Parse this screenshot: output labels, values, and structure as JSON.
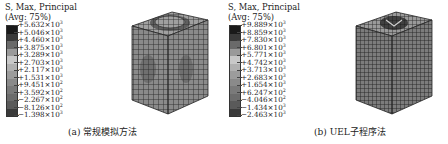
{
  "figure": {
    "panels": [
      {
        "id": "a",
        "legend": {
          "title_line1": "S, Max, Principal",
          "title_line2": "(Avg: 75%)",
          "swatch_colors": [
            "#1a1a1a",
            "#3a3a3a",
            "#6a6a6a",
            "#9a9a9a",
            "#c8c8c8",
            "#b0b0b0",
            "#9c9c9c",
            "#8a8a8a",
            "#7a7a7a",
            "#6c6c6c",
            "#5a5a5a",
            "#3a3a3a",
            "#222222"
          ],
          "labels": [
            {
              "mantissa": "+5.632",
              "exp": "3"
            },
            {
              "mantissa": "+5.046",
              "exp": "3"
            },
            {
              "mantissa": "+4.460",
              "exp": "3"
            },
            {
              "mantissa": "+3.875",
              "exp": "3"
            },
            {
              "mantissa": "+3.289",
              "exp": "3"
            },
            {
              "mantissa": "+2.703",
              "exp": "3"
            },
            {
              "mantissa": "+2.117",
              "exp": "3"
            },
            {
              "mantissa": "+1.531",
              "exp": "3"
            },
            {
              "mantissa": "+9.451",
              "exp": "2"
            },
            {
              "mantissa": "+3.592",
              "exp": "2"
            },
            {
              "mantissa": "−2.267",
              "exp": "2"
            },
            {
              "mantissa": "−8.126",
              "exp": "2"
            },
            {
              "mantissa": "−1.398",
              "exp": "3"
            }
          ]
        },
        "model_feature": "circular-indent-top",
        "caption": "(a) 常规模拟方法"
      },
      {
        "id": "b",
        "legend": {
          "title_line1": "S, Max, Principal",
          "title_line2": "(Avg: 75%)",
          "swatch_colors": [
            "#1a1a1a",
            "#3a3a3a",
            "#6a6a6a",
            "#9a9a9a",
            "#c8c8c8",
            "#b0b0b0",
            "#9c9c9c",
            "#8a8a8a",
            "#7a7a7a",
            "#6c6c6c",
            "#5a5a5a",
            "#3a3a3a",
            "#222222"
          ],
          "labels": [
            {
              "mantissa": "+9.889",
              "exp": "3"
            },
            {
              "mantissa": "+8.859",
              "exp": "3"
            },
            {
              "mantissa": "+7.830",
              "exp": "3"
            },
            {
              "mantissa": "+6.801",
              "exp": "3"
            },
            {
              "mantissa": "+5.771",
              "exp": "3"
            },
            {
              "mantissa": "+4.742",
              "exp": "3"
            },
            {
              "mantissa": "+3.713",
              "exp": "3"
            },
            {
              "mantissa": "+2.683",
              "exp": "3"
            },
            {
              "mantissa": "+1.654",
              "exp": "3"
            },
            {
              "mantissa": "+6.247",
              "exp": "2"
            },
            {
              "mantissa": "−4.046",
              "exp": "2"
            },
            {
              "mantissa": "−1.434",
              "exp": "3"
            },
            {
              "mantissa": "−2.463",
              "exp": "3"
            }
          ]
        },
        "model_feature": "pyramid-indent-top",
        "caption": "(b) UEL子程序法"
      }
    ]
  }
}
